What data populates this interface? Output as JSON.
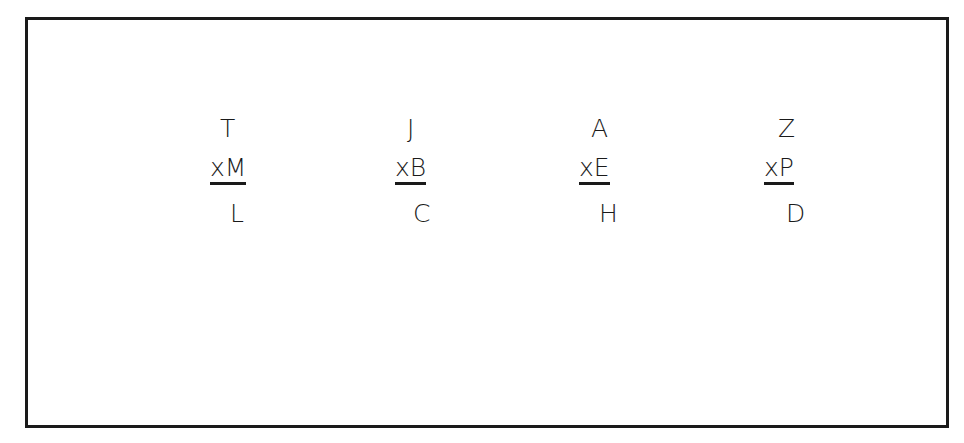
{
  "diagram": {
    "groups": [
      {
        "top": "T",
        "middle": "xM",
        "bottom": "L"
      },
      {
        "top": "J",
        "middle": "xB",
        "bottom": "C"
      },
      {
        "top": "A",
        "middle": "xE",
        "bottom": "H"
      },
      {
        "top": "Z",
        "middle": "xP",
        "bottom": "D"
      }
    ]
  }
}
